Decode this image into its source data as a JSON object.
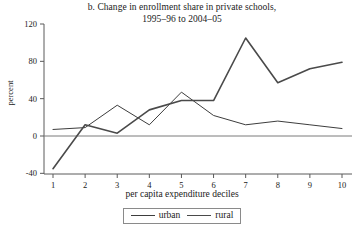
{
  "chart_data": {
    "type": "line",
    "title": "b. Change in enrollment share in private schools, 1995–96 to 2004–05",
    "title_lines": [
      "b. Change in enrollment share in private schools,",
      "1995–96 to 2004–05"
    ],
    "xlabel": "per capita expenditure deciles",
    "ylabel": "percent",
    "x": [
      1,
      2,
      3,
      4,
      5,
      6,
      7,
      8,
      9,
      10
    ],
    "categories": [
      "1",
      "2",
      "3",
      "4",
      "5",
      "6",
      "7",
      "8",
      "9",
      "10"
    ],
    "xtick_labels": [
      "1",
      "2",
      "3",
      "4",
      "5",
      "6",
      "7",
      "8",
      "9",
      "10"
    ],
    "ytick_labels": [
      "-40",
      "0",
      "40",
      "80",
      "120"
    ],
    "yticks": [
      -40,
      0,
      40,
      80,
      120
    ],
    "ylim": [
      -40,
      125
    ],
    "xlim": [
      0.6,
      10.5
    ],
    "grid": false,
    "zero_line": true,
    "legend_position": "below",
    "series": [
      {
        "name": "urban",
        "color": "#3d3d3d",
        "width": 1.0,
        "values": [
          7,
          9,
          33,
          12,
          47,
          22,
          12,
          16,
          12,
          8
        ]
      },
      {
        "name": "rural",
        "color": "#4a4a4a",
        "width": 1.6,
        "values": [
          -35,
          12,
          3,
          28,
          38,
          38,
          105,
          57,
          72,
          79
        ]
      }
    ]
  },
  "legend": {
    "entries": [
      {
        "label": "urban",
        "key": "urban"
      },
      {
        "label": "rural",
        "key": "rural"
      }
    ]
  }
}
